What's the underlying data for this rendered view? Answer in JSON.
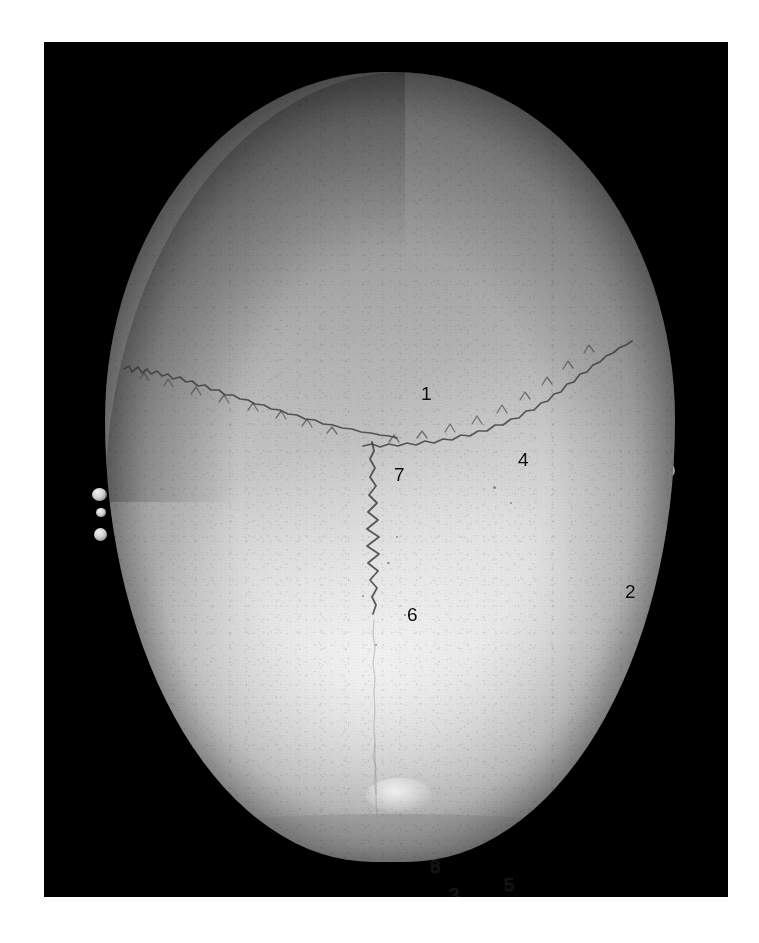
{
  "figure": {
    "caption": "",
    "view": "superior (vertex) view of the cranial vault",
    "frame_color": "#000000",
    "page_background": "#ffffff"
  },
  "specimen": {
    "name": "cranium-superior-view",
    "bone_light": "#dcdcdc",
    "bone_mid": "#b4b4b4",
    "bone_dark": "#808080"
  },
  "sutures": [
    {
      "id": "lambdoid-left",
      "name": "lambdoid-suture-left-limb",
      "label_ref": "4"
    },
    {
      "id": "lambdoid-right",
      "name": "lambdoid-suture-right-limb",
      "label_ref": "4"
    },
    {
      "id": "sagittal",
      "name": "sagittal-suture",
      "label_ref": "6"
    }
  ],
  "labels": [
    {
      "key": "l1",
      "text": "1",
      "x": 377,
      "y": 342,
      "name": "label-1-parietal-bone"
    },
    {
      "key": "l4",
      "text": "4",
      "x": 474,
      "y": 408,
      "name": "label-4-lambdoid-suture"
    },
    {
      "key": "l7",
      "text": "7",
      "x": 350,
      "y": 423,
      "name": "label-7-lambda"
    },
    {
      "key": "l2",
      "text": "2",
      "x": 581,
      "y": 540,
      "name": "label-2-occipital-bone"
    },
    {
      "key": "l6",
      "text": "6",
      "x": 363,
      "y": 563,
      "name": "label-6-sagittal-suture"
    },
    {
      "key": "l8",
      "text": "8",
      "x": 386,
      "y": 815,
      "name": "label-8-external-occipital-protuberance"
    },
    {
      "key": "l3",
      "text": "3",
      "x": 405,
      "y": 843,
      "name": "label-3-nuchal-line"
    },
    {
      "key": "l5",
      "text": "5",
      "x": 460,
      "y": 833,
      "name": "label-5-occipital-squama"
    }
  ]
}
